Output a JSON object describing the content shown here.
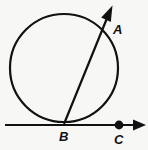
{
  "figure": {
    "background_color": "#f7f7f6",
    "stroke_color": "#111111",
    "width": 148,
    "height": 150,
    "labels": {
      "a": "A",
      "b": "B",
      "c": "C"
    },
    "points": [
      {
        "name": "A",
        "label": "A",
        "x": 108,
        "y": 30,
        "marker": "none",
        "description": "point on circle where ray exits"
      },
      {
        "name": "B",
        "label": "B",
        "x": 64,
        "y": 124,
        "marker": "none",
        "description": "tangent point at bottom of circle"
      },
      {
        "name": "C",
        "label": "C",
        "x": 119,
        "y": 125,
        "marker": "filled-dot",
        "description": "point on tangent line right of B"
      }
    ],
    "circle": {
      "name": "main-circle",
      "center_x": 64,
      "center_y": 68,
      "radius": 54,
      "stroke_width": 2.2
    },
    "tangent_line": {
      "name": "tangent-ray-BC",
      "x1": 5,
      "y1": 125,
      "x2": 145,
      "y2": 125,
      "stroke_width": 2.2,
      "arrow": "end"
    },
    "secant_ray": {
      "name": "secant-ray-BA",
      "x1": 64,
      "y1": 124,
      "x2": 112,
      "y2": 7,
      "stroke_width": 2.2,
      "arrow": "end"
    },
    "dot": {
      "name": "point-c-dot",
      "cx": 119,
      "cy": 125,
      "r": 4.4
    }
  }
}
